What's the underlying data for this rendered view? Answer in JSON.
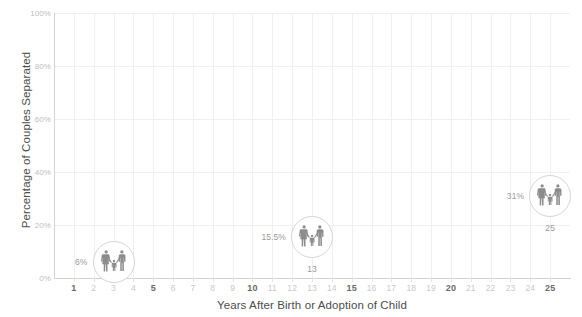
{
  "chart_data": {
    "type": "scatter",
    "title": "",
    "xlabel": "Years After Birth or Adoption of Child",
    "ylabel": "Percentage of Couples Separated",
    "xlim": [
      0,
      26
    ],
    "ylim": [
      0,
      100
    ],
    "grid": true,
    "legend": "none",
    "x_ticks": [
      1,
      2,
      3,
      4,
      5,
      6,
      7,
      8,
      9,
      10,
      11,
      12,
      13,
      14,
      15,
      16,
      17,
      18,
      19,
      20,
      21,
      22,
      23,
      24,
      25
    ],
    "x_tick_labels": [
      "1",
      "2",
      "3",
      "4",
      "5",
      "6",
      "7",
      "8",
      "9",
      "10",
      "11",
      "12",
      "13",
      "14",
      "15",
      "16",
      "17",
      "18",
      "19",
      "20",
      "21",
      "22",
      "23",
      "24",
      "25"
    ],
    "x_major_ticks": [
      1,
      5,
      10,
      15,
      20,
      25
    ],
    "y_ticks": [
      0,
      20,
      40,
      60,
      80,
      100
    ],
    "y_tick_labels": [
      "0%",
      "20%",
      "40%",
      "60%",
      "80%",
      "100%"
    ],
    "marker_icon": "family-icon",
    "points": [
      {
        "x": 3,
        "y": 6,
        "pct_label": "6%",
        "year_label": ""
      },
      {
        "x": 13,
        "y": 15.5,
        "pct_label": "15.5%",
        "year_label": "13"
      },
      {
        "x": 25,
        "y": 31,
        "pct_label": "31%",
        "year_label": "25"
      }
    ]
  },
  "colors": {
    "grid": "#f0f0f0",
    "axis": "#d2d2d2",
    "tick_label": "#c9c9c9",
    "tick_label_major": "#6a6a6a",
    "axis_title": "#4d4d4d",
    "marker_ring": "#d6d6d6",
    "marker_icon": "#8c8c8c",
    "marker_label": "#9a9a9a",
    "background": "#ffffff"
  }
}
